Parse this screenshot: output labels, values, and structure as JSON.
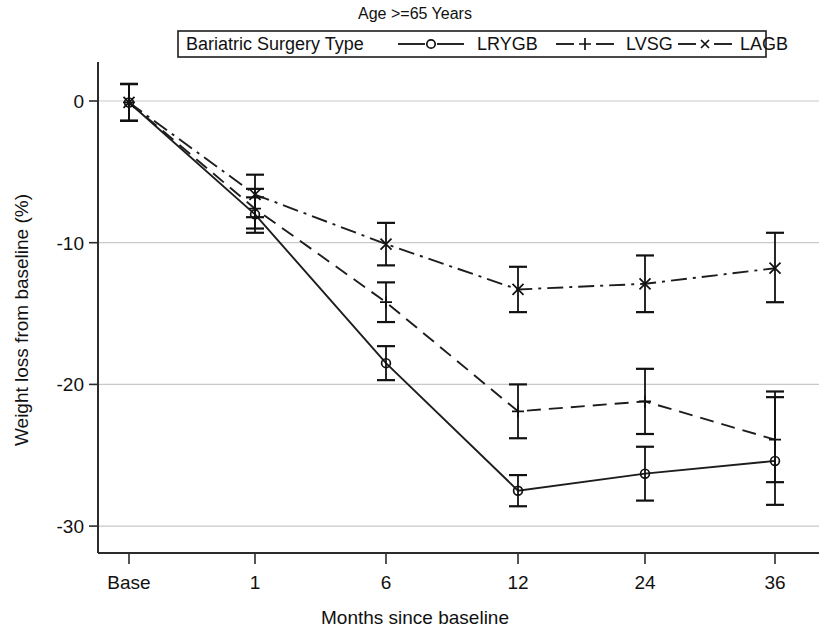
{
  "chart_data": {
    "type": "line",
    "title": "Age >=65 Years",
    "xlabel": "Months since baseline",
    "ylabel": "Weight loss from baseline (%)",
    "categories": [
      "Base",
      "1",
      "6",
      "12",
      "24",
      "36"
    ],
    "x_tick_labels": [
      "Base",
      "1",
      "6",
      "12",
      "24",
      "36"
    ],
    "y_tick_labels": [
      "0",
      "-10",
      "-20",
      "-30"
    ],
    "y_ticks": [
      0,
      -10,
      -20,
      -30
    ],
    "ylim": [
      -31,
      2
    ],
    "grid": "horizontal",
    "legend_position": "top",
    "legend_title": "Bariatric Surgery Type",
    "error_bars": "95% CI",
    "series": [
      {
        "name": "LRYGB",
        "marker": "circle",
        "dash": "solid",
        "values": [
          -0.1,
          -8.0,
          -18.5,
          -27.5,
          -26.3,
          -25.4
        ],
        "ci_low": [
          -1.4,
          -9.3,
          -19.7,
          -28.6,
          -28.2,
          -28.5
        ],
        "ci_high": [
          1.2,
          -6.8,
          -17.3,
          -26.4,
          -24.4,
          -20.5
        ]
      },
      {
        "name": "LVSG",
        "marker": "plus",
        "dash": "dashed",
        "values": [
          -0.1,
          -7.6,
          -14.2,
          -21.9,
          -21.2,
          -23.9
        ],
        "ci_low": [
          -1.4,
          -9.0,
          -15.6,
          -23.8,
          -23.5,
          -26.9
        ],
        "ci_high": [
          1.2,
          -6.2,
          -12.8,
          -20.0,
          -18.9,
          -20.9
        ]
      },
      {
        "name": "LAGB",
        "marker": "cross",
        "dash": "dashdot",
        "values": [
          -0.1,
          -6.6,
          -10.1,
          -13.3,
          -12.9,
          -11.8
        ],
        "ci_low": [
          -1.4,
          -8.2,
          -11.6,
          -14.9,
          -14.9,
          -14.2
        ],
        "ci_high": [
          1.2,
          -5.2,
          -8.6,
          -11.7,
          -10.9,
          -9.3
        ]
      }
    ]
  },
  "colors": {
    "ink": "#1a1a1a",
    "grid": "#c9c9c9",
    "background": "#ffffff"
  }
}
